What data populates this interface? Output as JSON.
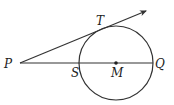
{
  "diagram": {
    "points": {
      "P": "P",
      "T": "T",
      "S": "S",
      "M": "M",
      "Q": "Q"
    },
    "colors": {
      "stroke": "#333333",
      "label": "#222222",
      "background": "#ffffff"
    }
  }
}
